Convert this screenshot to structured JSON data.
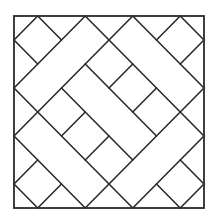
{
  "figure": {
    "colors": {
      "background": "#ffffff",
      "stroke": "#2b2b2b"
    },
    "frame": {
      "x": 14,
      "y": 16,
      "width": 190,
      "height": 192,
      "grid_units": 8
    },
    "segments": [
      {
        "group": "diamond-top-left",
        "from": [
          1,
          0
        ],
        "to": [
          0,
          1
        ]
      },
      {
        "group": "diamond-top-left",
        "from": [
          0,
          1
        ],
        "to": [
          1,
          2
        ]
      },
      {
        "group": "diamond-top-left",
        "from": [
          1,
          0
        ],
        "to": [
          2,
          1
        ]
      },
      {
        "group": "diamond-top-right",
        "from": [
          7,
          0
        ],
        "to": [
          8,
          1
        ]
      },
      {
        "group": "diamond-top-right",
        "from": [
          7,
          0
        ],
        "to": [
          6,
          1
        ]
      },
      {
        "group": "diamond-top-right",
        "from": [
          8,
          1
        ],
        "to": [
          7,
          2
        ]
      },
      {
        "group": "diamond-bottom-right",
        "from": [
          7,
          8
        ],
        "to": [
          8,
          7
        ]
      },
      {
        "group": "diamond-bottom-right",
        "from": [
          8,
          7
        ],
        "to": [
          7,
          6
        ]
      },
      {
        "group": "diamond-bottom-right",
        "from": [
          7,
          8
        ],
        "to": [
          6,
          7
        ]
      },
      {
        "group": "diamond-bottom-left",
        "from": [
          1,
          8
        ],
        "to": [
          0,
          7
        ]
      },
      {
        "group": "diamond-bottom-left",
        "from": [
          1,
          8
        ],
        "to": [
          2,
          7
        ]
      },
      {
        "group": "diamond-bottom-left",
        "from": [
          0,
          7
        ],
        "to": [
          1,
          6
        ]
      },
      {
        "group": "long-line",
        "from": [
          3,
          0
        ],
        "to": [
          0,
          3
        ]
      },
      {
        "group": "long-line",
        "from": [
          5,
          0
        ],
        "to": [
          0,
          5
        ]
      },
      {
        "group": "long-line",
        "from": [
          3,
          0
        ],
        "to": [
          8,
          5
        ]
      },
      {
        "group": "long-line",
        "from": [
          5,
          0
        ],
        "to": [
          8,
          3
        ]
      },
      {
        "group": "long-line",
        "from": [
          8,
          5
        ],
        "to": [
          5,
          8
        ]
      },
      {
        "group": "long-line",
        "from": [
          8,
          3
        ],
        "to": [
          3,
          8
        ]
      },
      {
        "group": "long-line",
        "from": [
          0,
          3
        ],
        "to": [
          5,
          8
        ]
      },
      {
        "group": "long-line",
        "from": [
          0,
          5
        ],
        "to": [
          3,
          8
        ]
      },
      {
        "group": "inner-line",
        "from": [
          3,
          2
        ],
        "to": [
          6,
          5
        ]
      },
      {
        "group": "inner-line",
        "from": [
          2,
          3
        ],
        "to": [
          5,
          6
        ]
      },
      {
        "group": "inner-cross",
        "from": [
          4,
          3
        ],
        "to": [
          5,
          2
        ]
      },
      {
        "group": "inner-cross",
        "from": [
          3,
          6
        ],
        "to": [
          4,
          5
        ]
      },
      {
        "group": "inner-cross",
        "from": [
          2,
          5
        ],
        "to": [
          3,
          4
        ]
      },
      {
        "group": "inner-cross",
        "from": [
          5,
          4
        ],
        "to": [
          6,
          3
        ]
      }
    ]
  }
}
